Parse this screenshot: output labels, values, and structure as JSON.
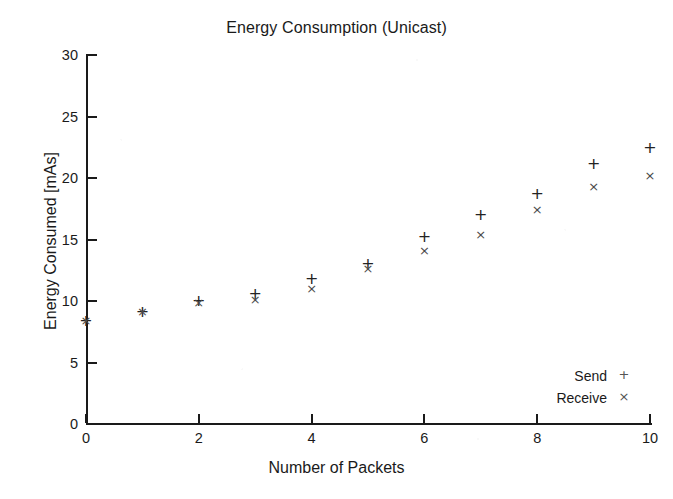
{
  "chart_data": {
    "type": "scatter",
    "title": "Energy Consumption (Unicast)",
    "xlabel": "Number of Packets",
    "ylabel": "Energy Consumed [mAs]",
    "xlim": [
      0,
      10
    ],
    "ylim": [
      0,
      30
    ],
    "xticks": [
      "0",
      "2",
      "4",
      "6",
      "8",
      "10"
    ],
    "xtick_values": [
      0,
      2,
      4,
      6,
      8,
      10
    ],
    "yticks": [
      "0",
      "5",
      "10",
      "15",
      "20",
      "25",
      "30"
    ],
    "ytick_values": [
      0,
      5,
      10,
      15,
      20,
      25,
      30
    ],
    "grid": false,
    "legend_position": "bottom-right",
    "x": [
      0,
      1,
      2,
      3,
      4,
      5,
      6,
      7,
      8,
      9,
      10
    ],
    "series": [
      {
        "name": "Send",
        "marker": "+",
        "color": "#232323",
        "values": [
          8.4,
          9.1,
          10.0,
          10.6,
          11.8,
          13.0,
          15.2,
          17.0,
          18.7,
          21.1,
          22.4
        ]
      },
      {
        "name": "Receive",
        "marker": "×",
        "color": "#4a4a4a",
        "values": [
          8.4,
          9.1,
          9.8,
          10.1,
          11.0,
          12.6,
          14.1,
          15.4,
          17.4,
          19.3,
          20.2
        ]
      }
    ]
  },
  "legend": {
    "entries": [
      {
        "label": "Send",
        "symbol": "+"
      },
      {
        "label": "Receive",
        "symbol": "×"
      }
    ]
  },
  "colors": {
    "axis": "#1a1a1a",
    "text": "#1a1a1a",
    "background": "#ffffff",
    "send": "#232323",
    "receive": "#4a4a4a"
  }
}
